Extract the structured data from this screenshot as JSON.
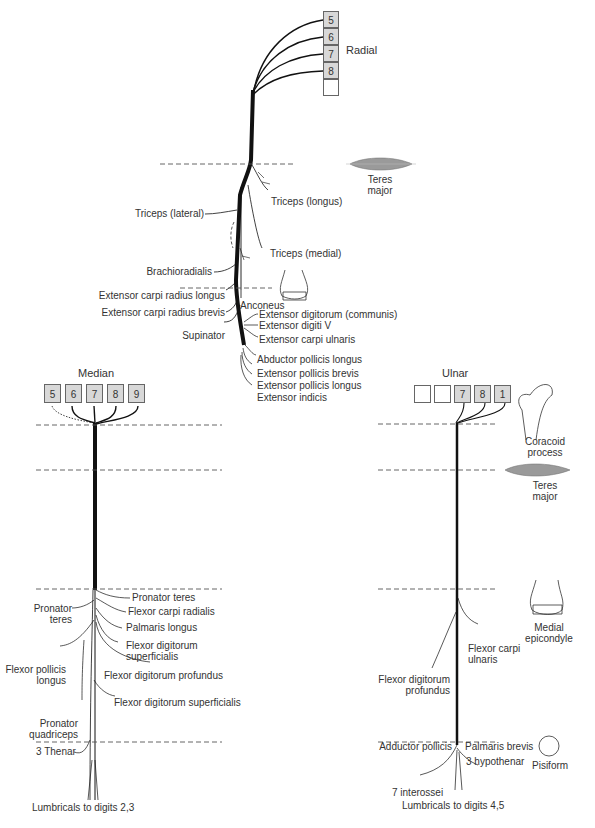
{
  "radial": {
    "title": "Radial",
    "roots": [
      "5",
      "6",
      "7",
      "8",
      ""
    ],
    "branches": [
      "Triceps (longus)",
      "Triceps (lateral)",
      "Triceps (medial)",
      "Brachioradialis",
      "Extensor carpi radius longus",
      "Extensor carpi radius brevis",
      "Anconeus",
      "Supinator",
      "Extensor digitorum (communis)",
      "Extensor digiti V",
      "Extensor carpi ulnaris",
      "Abductor pollicis longus",
      "Extensor pollicis brevis",
      "Extensor pollicis longus",
      "Extensor indicis"
    ]
  },
  "median": {
    "title": "Median",
    "roots": [
      "5",
      "6",
      "7",
      "8",
      "9"
    ],
    "branches": [
      "Pronator teres",
      "Pronator\nteres",
      "Flexor carpi radialis",
      "Palmaris longus",
      "Flexor digitorum\nsuperficialis",
      "Flexor pollicis\nlongus",
      "Flexor digitorum profundus",
      "Flexor digitorum superficialis",
      "Pronator\nquadriceps",
      "3 Thenar",
      "Lumbricals to digits 2,3"
    ]
  },
  "ulnar": {
    "title": "Ulnar",
    "roots": [
      "",
      "",
      "7",
      "8",
      "1"
    ],
    "branches": [
      "Flexor carpi\nulnaris",
      "Flexor digitorum\nprofundus",
      "Adductor pollicis",
      "Palmaris brevis",
      "3 hypothenar",
      "7 interossei",
      "Lumbricals to digits 4,5"
    ]
  },
  "landmarks": {
    "teres_major_top": "Teres\nmajor",
    "coracoid": "Coracoid\nprocess",
    "teres_major_right": "Teres\nmajor",
    "medial_epicondyle": "Medial\nepicondyle",
    "pisiform": "Pisiform"
  },
  "colors": {
    "nerve": "#111111",
    "text": "#333333",
    "box_fill": "#d8d8d8",
    "box_border": "#666666",
    "dashed": "#555555",
    "muscle": "#9a9a9a"
  }
}
